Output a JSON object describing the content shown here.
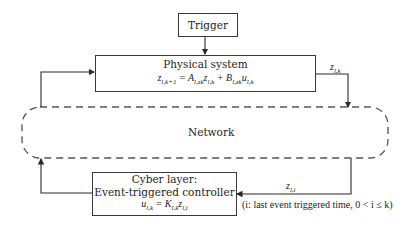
{
  "diagram": {
    "trigger": {
      "label": "Trigger"
    },
    "physical_system": {
      "title": "Physical system",
      "equation": "z_{l,k+1} = A_{l,zk} z_{l,k} + B_{l,zk} u_{l,k}",
      "equation_display": "zl,k+1 = Al,zkzl,k + Bl,zkul,k"
    },
    "network": {
      "label": "Network"
    },
    "cyber_layer": {
      "line1": "Cyber layer:",
      "line2": "Event-triggered controller",
      "equation": "u_{l,k} = K_{l,k} z_{l,i}",
      "equation_display": "ul,k = Kl,kzl,i"
    },
    "signals": {
      "plant_output": "z_{l,k}",
      "controller_input": "z_{l,i}",
      "note": "(i: last event triggered time, 0 < i ≤ k)"
    },
    "colors": {
      "line": "#3a3a3a",
      "dashed": "#555555",
      "background": "#ffffff"
    }
  }
}
